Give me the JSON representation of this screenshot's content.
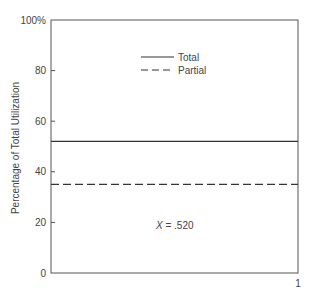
{
  "chart_data": {
    "type": "line",
    "title": "",
    "xlabel": "",
    "ylabel": "Percentage of Total Utilization",
    "ylim": [
      0,
      100
    ],
    "xlim": [
      0,
      1
    ],
    "y_ticks": [
      "0",
      "20",
      "40",
      "60",
      "80",
      "100%"
    ],
    "y_tick_values": [
      0,
      20,
      40,
      60,
      80,
      100
    ],
    "x_ticks": [
      "1"
    ],
    "x_tick_values": [
      1
    ],
    "grid": false,
    "legend_position": "top-center",
    "series": [
      {
        "name": "Total",
        "style": "solid",
        "x": [
          0,
          1
        ],
        "values": [
          52,
          52
        ]
      },
      {
        "name": "Partial",
        "style": "dashed",
        "x": [
          0,
          1
        ],
        "values": [
          35,
          35
        ]
      }
    ],
    "annotations": [
      {
        "text_var": "X",
        "text_rest": " = .520"
      }
    ]
  }
}
